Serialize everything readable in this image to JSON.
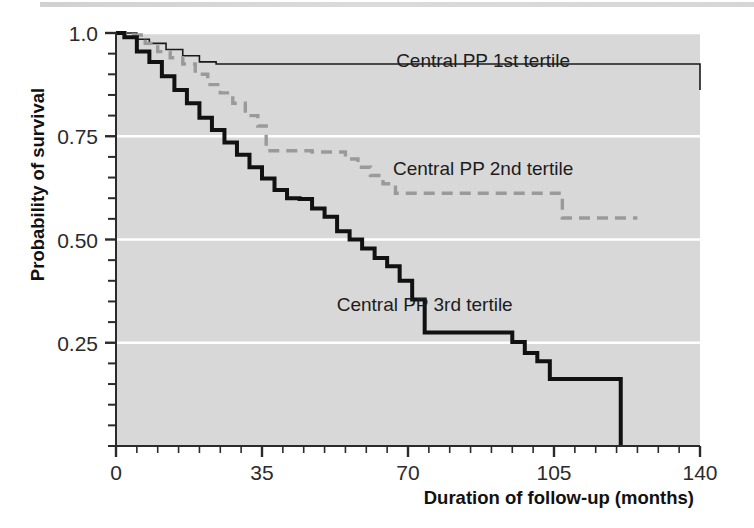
{
  "figure": {
    "kind": "kaplan-meier-survival-plot",
    "background_color": "#ffffff",
    "plot_background_color": "#d8d8d8",
    "gridline_color": "#ffffff",
    "axis_color": "#2b2b2b"
  },
  "chart_data": {
    "type": "line",
    "title": "",
    "subtitle": "",
    "xlabel": "Duration of follow-up (months)",
    "ylabel": "Probability of survival",
    "xlim": [
      0,
      140
    ],
    "ylim": [
      0,
      1.0
    ],
    "xticks": [
      0,
      35,
      70,
      105,
      140
    ],
    "xtick_labels": [
      "0",
      "35",
      "70",
      "105",
      "140"
    ],
    "x_minor_tick_step": 5,
    "yticks": [
      0.25,
      0.5,
      0.75,
      1.0
    ],
    "ytick_labels": [
      "0.25",
      "0.50",
      "0.75",
      "1.0"
    ],
    "y_minor_tick_step": 0.05,
    "grid": "horizontal-major-white",
    "legend_position": "inline-annotations",
    "step_shape": "post",
    "series": [
      {
        "name": "Central PP 1st tertile",
        "label": "Central PP 1st tertile",
        "color": "#1a1a1a",
        "line_style": "solid",
        "line_width": 1.6,
        "annotation": {
          "x": 88,
          "y": 0.935,
          "text": "Central PP 1st tertile"
        },
        "x": [
          0,
          2,
          5,
          8,
          12,
          16,
          20,
          24,
          90,
          140
        ],
        "y": [
          1.0,
          1.0,
          0.985,
          0.975,
          0.96,
          0.945,
          0.93,
          0.925,
          0.925,
          0.862
        ]
      },
      {
        "name": "Central PP 2nd tertile",
        "label": "Central PP 2nd tertile",
        "color": "#9a9a9a",
        "line_style": "dashed",
        "line_width": 3.4,
        "annotation": {
          "x": 88,
          "y": 0.672,
          "text": "Central PP 2nd tertile"
        },
        "x": [
          0,
          3,
          7,
          10,
          13,
          16,
          19,
          22,
          25,
          28,
          31,
          34,
          36,
          47,
          55,
          58,
          61,
          64,
          67,
          104,
          107,
          125
        ],
        "y": [
          1.0,
          0.995,
          0.975,
          0.955,
          0.94,
          0.925,
          0.9,
          0.875,
          0.855,
          0.83,
          0.8,
          0.775,
          0.715,
          0.712,
          0.695,
          0.675,
          0.655,
          0.635,
          0.612,
          0.612,
          0.552,
          0.552
        ]
      },
      {
        "name": "Central PP 3rd tertile",
        "label": "Central PP 3rd tertile",
        "color": "#111111",
        "line_style": "solid",
        "line_width": 4.0,
        "annotation": {
          "x": 74,
          "y": 0.345,
          "text": "Central PP 3rd tertile"
        },
        "x": [
          0,
          2,
          5,
          8,
          11,
          14,
          17,
          20,
          23,
          26,
          29,
          32,
          35,
          38,
          41,
          44,
          47,
          50,
          53,
          56,
          59,
          62,
          65,
          68,
          71,
          74,
          92,
          95,
          98,
          101,
          104,
          121,
          121
        ],
        "y": [
          1.0,
          0.99,
          0.955,
          0.93,
          0.895,
          0.862,
          0.83,
          0.795,
          0.765,
          0.735,
          0.705,
          0.675,
          0.648,
          0.62,
          0.6,
          0.598,
          0.575,
          0.555,
          0.52,
          0.5,
          0.478,
          0.455,
          0.435,
          0.4,
          0.355,
          0.275,
          0.275,
          0.252,
          0.225,
          0.205,
          0.162,
          0.162,
          0.0
        ]
      }
    ]
  }
}
